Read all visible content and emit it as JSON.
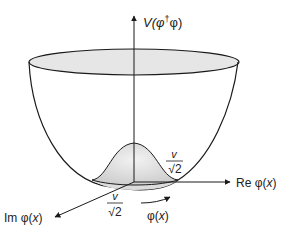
{
  "diagram": {
    "type": "mexican-hat-potential",
    "labels": {
      "v_axis": "V(φ†φ)",
      "v_axis_main": "V(φ",
      "v_axis_dagger": "†",
      "v_axis_tail": "φ)",
      "re_axis": "Re φ(x)",
      "re_main": "Re φ(",
      "re_x": "x",
      "re_close": ")",
      "im_axis": "Im φ(x)",
      "im_main": "Im φ(",
      "im_x": "x",
      "im_close": ")",
      "phi": "φ(x)",
      "phi_main": "φ(",
      "phi_x": "x",
      "phi_close": ")",
      "vev_numerator": "v",
      "vev_denominator": "√2"
    },
    "colors": {
      "line": "#1a1a1a",
      "fill_light": "#e6e6e6",
      "fill_hump": "#d9d9d9",
      "background": "#ffffff"
    }
  }
}
